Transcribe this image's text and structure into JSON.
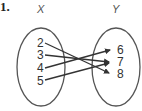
{
  "problem_number": "1.",
  "domain_set": {
    "label": "X",
    "elements": [
      "2",
      "3",
      "4",
      "5"
    ]
  },
  "range_set": {
    "label": "Y",
    "elements": [
      "6",
      "7",
      "8"
    ]
  },
  "mappings": [
    {
      "from": "2",
      "to": "8"
    },
    {
      "from": "3",
      "to": "7"
    },
    {
      "from": "4",
      "to": "6"
    },
    {
      "from": "5",
      "to": "7"
    }
  ],
  "colors": {
    "ink": "#333333",
    "background": "#ffffff"
  }
}
